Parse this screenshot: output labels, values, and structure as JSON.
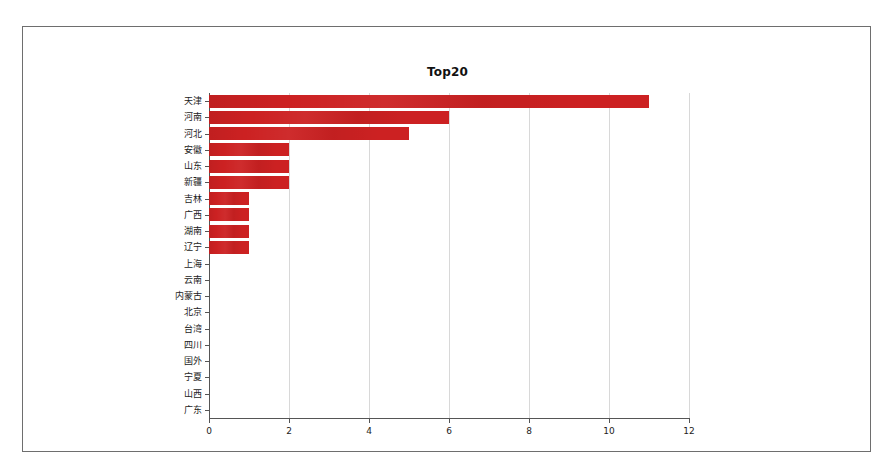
{
  "figure": {
    "title": "Top20",
    "bar_color": "#cc2122",
    "grid_color": "#d8d8d8",
    "axis_color": "#555555",
    "background": "#ffffff"
  },
  "chart_data": {
    "type": "bar",
    "orientation": "horizontal",
    "title": "Top20",
    "xlabel": "",
    "ylabel": "",
    "xlim": [
      0,
      12
    ],
    "grid": true,
    "legend": false,
    "xticks": [
      0,
      2,
      4,
      6,
      8,
      10,
      12
    ],
    "xtick_labels": [
      "0",
      "2",
      "4",
      "6",
      "8",
      "10",
      "12"
    ],
    "categories": [
      "天津",
      "河南",
      "河北",
      "安徽",
      "山东",
      "新疆",
      "吉林",
      "广西",
      "湖南",
      "辽宁",
      "上海",
      "云南",
      "内蒙古",
      "北京",
      "台湾",
      "四川",
      "国外",
      "宁夏",
      "山西",
      "广东"
    ],
    "values": [
      11,
      6,
      5,
      2,
      2,
      2,
      1,
      1,
      1,
      1,
      0,
      0,
      0,
      0,
      0,
      0,
      0,
      0,
      0,
      0
    ]
  }
}
